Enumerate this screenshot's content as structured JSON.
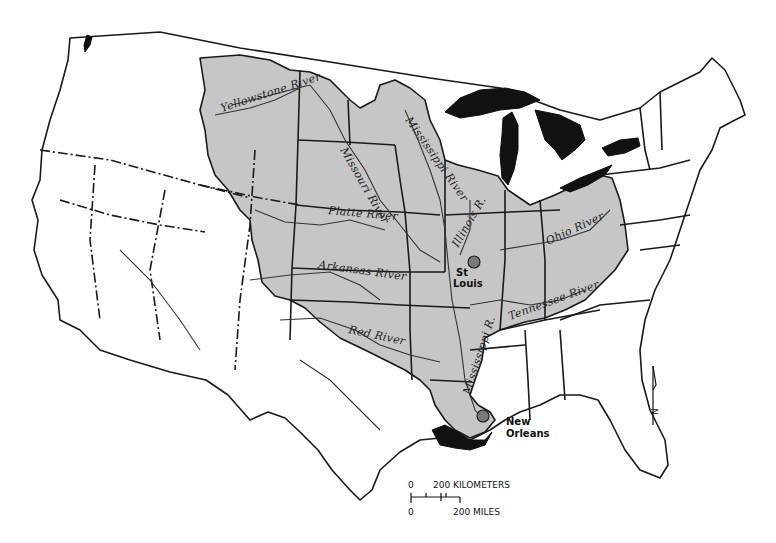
{
  "map": {
    "title": "Mississippi River Basin",
    "fill_color_basin": "#c6c6c6",
    "fill_color_water": "#111111",
    "rivers": [
      {
        "label": "Yellowstone River"
      },
      {
        "label": "Missouri River"
      },
      {
        "label": "Mississippi River"
      },
      {
        "label": "Platte River"
      },
      {
        "label": "Illinois R."
      },
      {
        "label": "Ohio River"
      },
      {
        "label": "Arkansas River"
      },
      {
        "label": "Red River"
      },
      {
        "label": "Tennessee River"
      },
      {
        "label": "Mississippi R."
      }
    ],
    "cities": [
      {
        "label_line1": "St",
        "label_line2": "Louis"
      },
      {
        "label_line1": "New",
        "label_line2": "Orleans"
      }
    ],
    "scale_bar": {
      "km_zero": "0",
      "km_label": "200 KILOMETERS",
      "mi_zero": "0",
      "mi_label": "200 MILES"
    },
    "north_arrow": {
      "label": "N"
    }
  }
}
